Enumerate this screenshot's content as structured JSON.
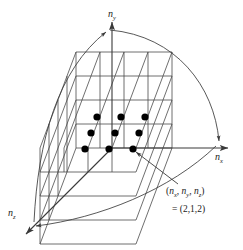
{
  "figure": {
    "type": "diagram",
    "background_color": "#ffffff",
    "line_color": "#3a3a3a",
    "dot_color": "#000000",
    "text_color": "#1a1a1a",
    "width": 243,
    "height": 250
  },
  "axes": [
    {
      "id": "nx",
      "label_base": "n",
      "label_sub": "x",
      "direction": "right",
      "arrowhead": true,
      "label_x": 215,
      "label_y": 152
    },
    {
      "id": "ny",
      "label_base": "n",
      "label_sub": "y",
      "direction": "up",
      "arrowhead": true,
      "label_x": 108,
      "label_y": 9
    },
    {
      "id": "nz",
      "label_base": "n",
      "label_sub": "z",
      "direction": "down-left",
      "arrowhead": true,
      "label_x": 8,
      "label_y": 208
    }
  ],
  "annotation": {
    "line1_prefix": "(",
    "line1_base1": "n",
    "line1_sub1": "x",
    "line1_sep1": ", ",
    "line1_base2": "n",
    "line1_sub2": "y",
    "line1_sep2": ", ",
    "line1_base3": "n",
    "line1_sub3": "z",
    "line1_suffix": ")",
    "line2": "= (2,1,2)",
    "points_to": "lattice-point",
    "pointer_arrowhead": true
  },
  "lattice": {
    "description": "Cubic grid of quantum states in n-space; filled circles mark occupied lattice points",
    "grid_divisions": 4,
    "dot_radius": 3.6,
    "dot_count": 9,
    "dots": [
      {
        "id": "dot-1",
        "cx": 97,
        "cy": 117
      },
      {
        "id": "dot-2",
        "cx": 121,
        "cy": 117
      },
      {
        "id": "dot-3",
        "cx": 145,
        "cy": 117
      },
      {
        "id": "dot-4",
        "cx": 91,
        "cy": 133
      },
      {
        "id": "dot-5",
        "cx": 115,
        "cy": 133
      },
      {
        "id": "dot-6",
        "cx": 139,
        "cy": 133
      },
      {
        "id": "dot-7",
        "cx": 85,
        "cy": 149
      },
      {
        "id": "dot-8",
        "cx": 109,
        "cy": 149
      },
      {
        "id": "dot-9",
        "cx": 133,
        "cy": 149
      }
    ]
  },
  "shell": {
    "description": "Quarter-circle arc of constant radius n, from nz axis through to ny and nx axes",
    "arc_count": 3,
    "style": "thin solid curve with arrowheads at axis ends"
  }
}
